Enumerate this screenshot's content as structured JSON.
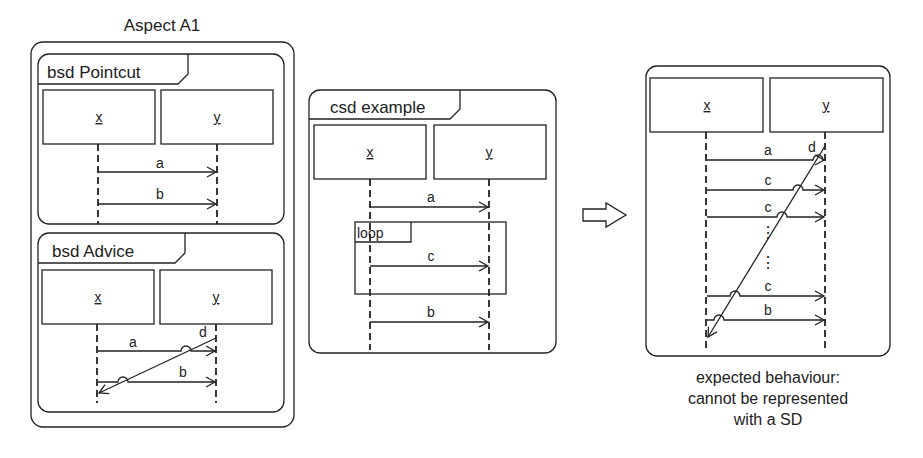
{
  "aspect": {
    "title": "Aspect A1",
    "pointcut": {
      "label": "bsd Pointcut",
      "lifelines": [
        "x",
        "y"
      ],
      "messages": [
        "a",
        "b"
      ]
    },
    "advice": {
      "label": "bsd Advice",
      "lifelines": [
        "x",
        "y"
      ],
      "messages": [
        "a",
        "b"
      ],
      "diagonal_message": "d"
    }
  },
  "example": {
    "label": "csd example",
    "lifelines": [
      "x",
      "y"
    ],
    "messages": [
      "a",
      "c",
      "b"
    ],
    "fragment": "loop"
  },
  "transition_arrow": "right-arrow",
  "result": {
    "lifelines": [
      "x",
      "y"
    ],
    "messages": [
      "a",
      "c",
      "c",
      "c",
      "b"
    ],
    "diagonal_message": "d",
    "ellipsis": "⋮",
    "caption": [
      "expected behaviour:",
      "cannot be represented",
      "with a SD"
    ]
  }
}
